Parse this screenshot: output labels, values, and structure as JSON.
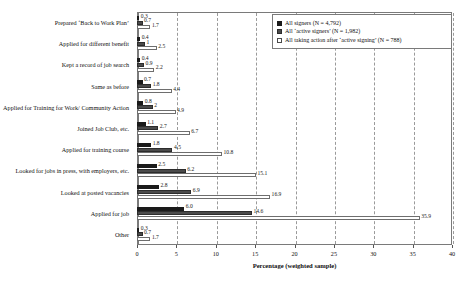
{
  "chart_data": {
    "type": "bar",
    "orientation": "horizontal",
    "title": "",
    "xlabel": "Percentage (weighted sample)",
    "ylabel": "",
    "xlim": [
      0,
      40
    ],
    "xticks": [
      0,
      5,
      10,
      15,
      20,
      25,
      30,
      35,
      40
    ],
    "xtick_labels": [
      "0",
      "5",
      "10",
      "15",
      "20",
      "25",
      "30",
      "35",
      "40"
    ],
    "grid": "vertical-dashed",
    "legend_position": "top-right",
    "categories": [
      "Prepared ‘Back to Work Plan’",
      "Applied for different benefit",
      "Kept a record of job search",
      "Same as before",
      "Applied for Training for Work/ Community Action",
      "Joined Job Club, etc.",
      "Applied for training course",
      "Looked for jobs in press, with employers, etc.",
      "Looked at posted vacancies",
      "Applied for job",
      "Other"
    ],
    "series": [
      {
        "name": "All signers (N = 4,792)",
        "color": "#1a1a1a",
        "values": [
          0.3,
          0.4,
          0.4,
          0.7,
          0.8,
          1.1,
          1.8,
          2.5,
          2.8,
          6.0,
          0.3
        ],
        "labels": [
          "0.3",
          "0.4",
          "0.4",
          "0.7",
          "0.8",
          "1.1",
          "1.8",
          "2.5",
          "2.8",
          "6.0",
          "0.3"
        ]
      },
      {
        "name": "All ‘active signers’ (N = 1,982)",
        "color": "#4a4a4a",
        "values": [
          0.7,
          1.0,
          0.9,
          1.8,
          2.0,
          2.7,
          4.5,
          6.2,
          6.9,
          14.6,
          0.7
        ],
        "labels": [
          "0.7",
          "1",
          "0.9",
          "1.8",
          "2",
          "2.7",
          "4.5",
          "6.2",
          "6.9",
          "14.6",
          "0.7"
        ]
      },
      {
        "name": "All taking action after ‘active signing’ (N = 788)",
        "color": "#ffffff",
        "values": [
          1.7,
          2.5,
          2.2,
          4.4,
          4.9,
          6.7,
          10.8,
          15.1,
          16.9,
          35.9,
          1.7
        ],
        "labels": [
          "1.7",
          "2.5",
          "2.2",
          "4.4",
          "4.9",
          "6.7",
          "10.8",
          "15.1",
          "16.9",
          "35.9",
          "1.7"
        ]
      }
    ]
  },
  "legend": {
    "entries": [
      "All signers (N = 4,792)",
      "All ‘active signers’ (N = 1,982)",
      "All taking action after ‘active signing’ (N = 788)"
    ]
  },
  "axis": {
    "x_title": "Percentage (weighted sample)"
  }
}
